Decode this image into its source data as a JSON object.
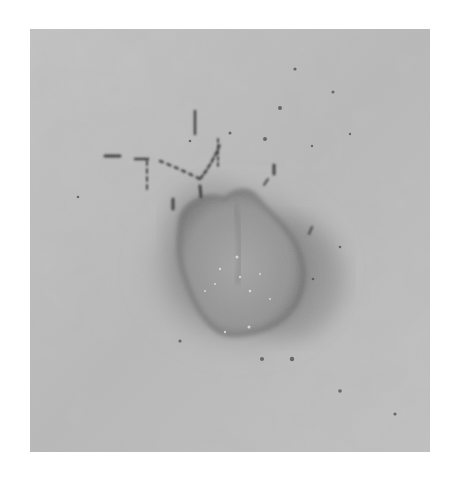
{
  "image": {
    "kind": "grayscale clinical photograph",
    "subject": "raised skin lesion with surrounding dark halo and nearby hairs",
    "frame": {
      "x": 30,
      "y": 29,
      "width": 400,
      "height": 423,
      "border_color": "#ffffff"
    },
    "colors": {
      "skin_light": "#c6c6c6",
      "skin_mid": "#b6b6b6",
      "halo": "#8c8c8c",
      "lesion_body": "#949494",
      "lesion_rim": "#666666",
      "hair": "#3a3a3a",
      "highlight": "#e6e6e6"
    }
  }
}
